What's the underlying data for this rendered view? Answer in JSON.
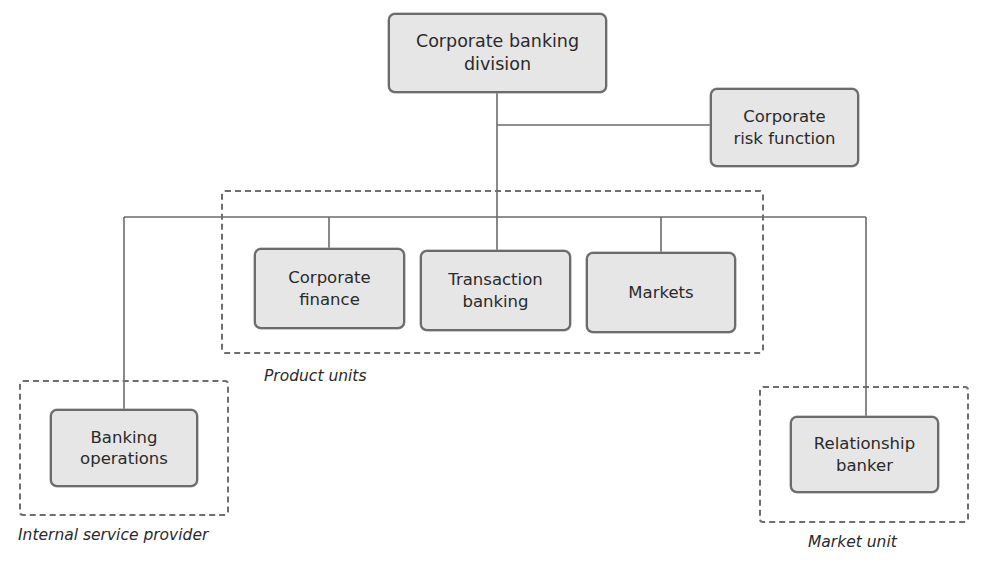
{
  "diagram": {
    "type": "organizational-chart",
    "nodes": {
      "division": {
        "label": "Corporate banking\ndivision"
      },
      "risk": {
        "label": "Corporate\nrisk function"
      },
      "corporate_finance": {
        "label": "Corporate\nfinance"
      },
      "transaction_banking": {
        "label": "Transaction\nbanking"
      },
      "markets": {
        "label": "Markets"
      },
      "banking_operations": {
        "label": "Banking\noperations"
      },
      "relationship_banker": {
        "label": "Relationship\nbanker"
      }
    },
    "groups": {
      "product_units": {
        "label": "Product units",
        "members": [
          "corporate_finance",
          "transaction_banking",
          "markets"
        ]
      },
      "internal_service_provider": {
        "label": "Internal service provider",
        "members": [
          "banking_operations"
        ]
      },
      "market_unit": {
        "label": "Market unit",
        "members": [
          "relationship_banker"
        ]
      }
    },
    "edges": [
      {
        "from": "division",
        "to": "risk"
      },
      {
        "from": "division",
        "to": "corporate_finance"
      },
      {
        "from": "division",
        "to": "transaction_banking"
      },
      {
        "from": "division",
        "to": "markets"
      },
      {
        "from": "division",
        "to": "banking_operations"
      },
      {
        "from": "division",
        "to": "relationship_banker"
      }
    ],
    "colors": {
      "box_fill": "#e6e6e6",
      "box_border": "#6b6b6b",
      "line": "#6b6b6b"
    }
  }
}
